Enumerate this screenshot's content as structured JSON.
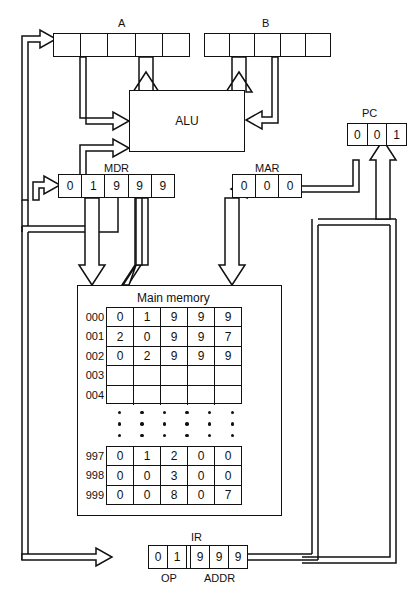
{
  "diagram": {
    "registers": {
      "a": {
        "label": "A",
        "cells": [
          "",
          "",
          "",
          "",
          ""
        ]
      },
      "b": {
        "label": "B",
        "cells": [
          "",
          "",
          "",
          "",
          ""
        ]
      },
      "alu": {
        "label": "ALU"
      },
      "pc": {
        "label": "PC",
        "cells": [
          "0",
          "0",
          "1"
        ]
      },
      "mdr": {
        "label": "MDR",
        "cells": [
          "0",
          "1",
          "9",
          "9",
          "9"
        ]
      },
      "mar": {
        "label": "MAR",
        "cells": [
          "0",
          "0",
          "0"
        ]
      },
      "ir": {
        "label": "IR",
        "op_label": "OP",
        "addr_label": "ADDR",
        "op_cells": [
          "0",
          "1"
        ],
        "addr_cells": [
          "9",
          "9",
          "9"
        ]
      }
    },
    "memory": {
      "title": "Main memory",
      "top_rows": [
        {
          "address": "000",
          "cells": [
            "0",
            "1",
            "9",
            "9",
            "9"
          ]
        },
        {
          "address": "001",
          "cells": [
            "2",
            "0",
            "9",
            "9",
            "7"
          ]
        },
        {
          "address": "002",
          "cells": [
            "0",
            "2",
            "9",
            "9",
            "9"
          ]
        },
        {
          "address": "003",
          "cells": [
            "",
            "",
            "",
            "",
            ""
          ]
        },
        {
          "address": "004",
          "cells": [
            "",
            "",
            "",
            "",
            ""
          ]
        }
      ],
      "ellipsis_columns": 6,
      "ellipsis_dots_per_column": 3,
      "bottom_rows": [
        {
          "address": "997",
          "cells": [
            "0",
            "1",
            "2",
            "0",
            "0"
          ]
        },
        {
          "address": "998",
          "cells": [
            "0",
            "0",
            "3",
            "0",
            "0"
          ]
        },
        {
          "address": "999",
          "cells": [
            "0",
            "0",
            "8",
            "0",
            "7"
          ]
        }
      ]
    },
    "colors": {
      "line": "#111111",
      "background": "#ffffff"
    }
  }
}
